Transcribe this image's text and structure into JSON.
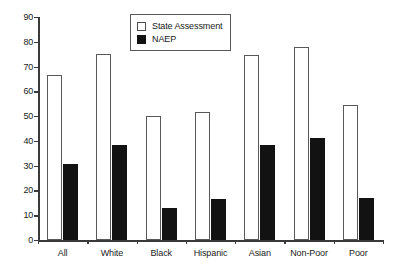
{
  "chart_data": {
    "type": "bar",
    "title": "",
    "subtitle": "",
    "xlabel": "",
    "ylabel": "",
    "categories": [
      "All",
      "White",
      "Black",
      "Hispanic",
      "Asian",
      "Non-Poor",
      "Poor"
    ],
    "series": [
      {
        "name": "State Assessment",
        "color": "#ffffff",
        "edge_color": "#595959",
        "values": [
          66.5,
          75,
          50,
          51.5,
          74.5,
          78,
          54.5
        ]
      },
      {
        "name": "NAEP",
        "color": "#121212",
        "edge_color": "#121212",
        "values": [
          30.5,
          38.5,
          13,
          16.5,
          38.5,
          41,
          17
        ]
      }
    ],
    "ylim": [
      0,
      90
    ],
    "ytick_values": [
      0,
      10,
      20,
      30,
      40,
      50,
      60,
      70,
      80,
      90
    ],
    "ytick_labels": [
      "0",
      "10",
      "20",
      "30",
      "40",
      "50",
      "60",
      "70",
      "80",
      "90"
    ],
    "grid": false,
    "legend_position": "top-center",
    "background_color": "#ffffff",
    "axis_color": "#3a3a3a"
  },
  "legend": {
    "entries": [
      {
        "label": "State Assessment",
        "swatch": "hollow-square-icon"
      },
      {
        "label": "NAEP",
        "swatch": "filled-square-icon"
      }
    ]
  }
}
